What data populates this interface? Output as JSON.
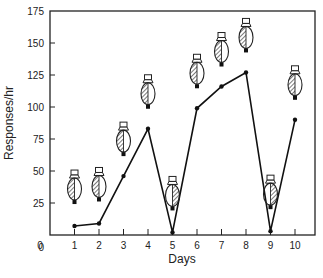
{
  "chart_data": {
    "type": "line",
    "title": "",
    "xlabel": "Days",
    "ylabel": "Responses/hr",
    "x": [
      1,
      2,
      3,
      4,
      5,
      6,
      7,
      8,
      9,
      10
    ],
    "categories": [
      "1",
      "2",
      "3",
      "4",
      "5",
      "6",
      "7",
      "8",
      "9",
      "10"
    ],
    "series": [
      {
        "name": "Responses/hr",
        "values": [
          7,
          9,
          46,
          83,
          2,
          99,
          116,
          127,
          3,
          90
        ]
      }
    ],
    "bulb_hatched_side": [
      "left",
      "left",
      "left",
      "left",
      "right",
      "left",
      "left",
      "left",
      "right",
      "left"
    ],
    "xlim": [
      0,
      10.5
    ],
    "ylim": [
      0,
      175
    ],
    "x_ticks": [
      "0",
      "1",
      "2",
      "3",
      "4",
      "5",
      "6",
      "7",
      "8",
      "9",
      "10"
    ],
    "y_ticks": [
      "0",
      "25",
      "50",
      "75",
      "100",
      "125",
      "150",
      "175"
    ],
    "grid": false,
    "legend": "none",
    "annotations": "Bulb icons above each point; hatched half indicates lit side"
  },
  "axes": {
    "xlabel": "Days",
    "ylabel": "Responses/hr"
  }
}
